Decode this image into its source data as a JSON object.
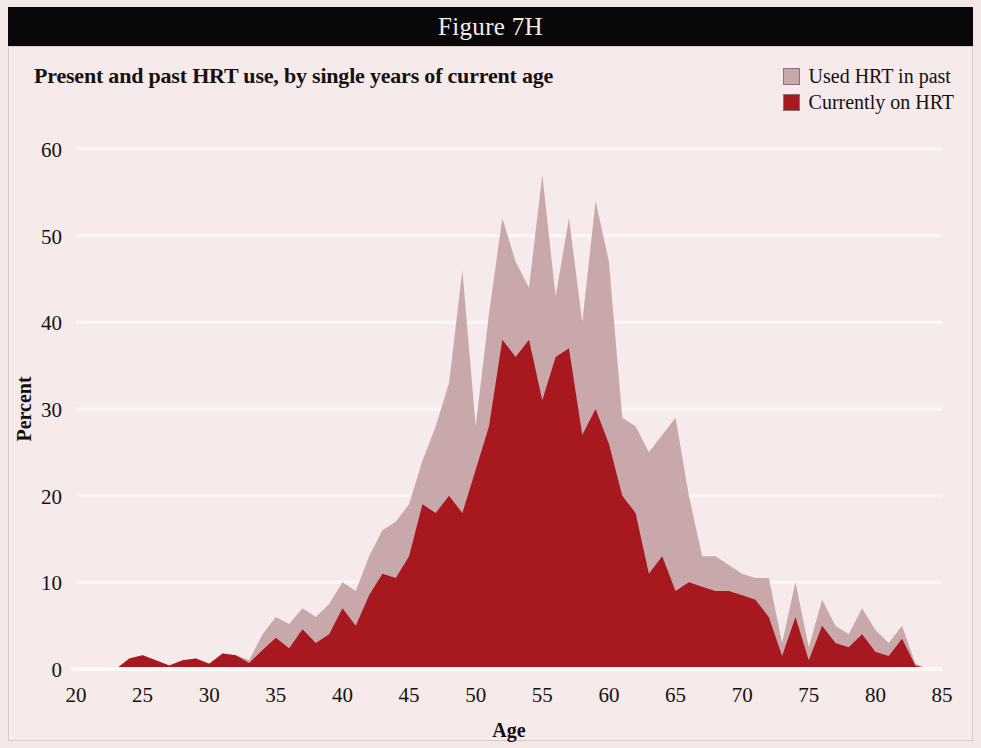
{
  "figure": {
    "header_label": "Figure 7H"
  },
  "chart_title": "Present and past HRT use, by single years of current age",
  "legend": {
    "position": "top-right",
    "entries": [
      {
        "label": "Used HRT in past",
        "color": "#c9a8ab"
      },
      {
        "label": "Currently on HRT",
        "color": "#a8191f"
      }
    ]
  },
  "colors": {
    "panel_background": "#f6eaea",
    "page_background": "#f3e7e7",
    "header_bar": "#0a0708",
    "gridline": "#fdf7f6",
    "past_hrt": "#c9a8ab",
    "current_hrt": "#a8191f",
    "text": "#15100f"
  },
  "chart_data": {
    "type": "area",
    "title": "Present and past HRT use, by single years of current age",
    "subtitle": "",
    "xlabel": "Age",
    "ylabel": "Percent",
    "xlim": [
      20,
      85
    ],
    "ylim": [
      0,
      60
    ],
    "xticks": [
      20,
      25,
      30,
      35,
      40,
      45,
      50,
      55,
      60,
      65,
      70,
      75,
      80,
      85
    ],
    "yticks": [
      0,
      10,
      20,
      30,
      40,
      50,
      60
    ],
    "grid": true,
    "stacking": "overlaid",
    "legend_position": "top-right",
    "x": [
      20,
      21,
      22,
      23,
      24,
      25,
      26,
      27,
      28,
      29,
      30,
      31,
      32,
      33,
      34,
      35,
      36,
      37,
      38,
      39,
      40,
      41,
      42,
      43,
      44,
      45,
      46,
      47,
      48,
      49,
      50,
      51,
      52,
      53,
      54,
      55,
      56,
      57,
      58,
      59,
      60,
      61,
      62,
      63,
      64,
      65,
      66,
      67,
      68,
      69,
      70,
      71,
      72,
      73,
      74,
      75,
      76,
      77,
      78,
      79,
      80,
      81,
      82,
      83,
      84,
      85
    ],
    "series": [
      {
        "name": "Used HRT in past",
        "color": "#c9a8ab",
        "values": [
          0,
          0,
          0,
          0,
          1.2,
          1.6,
          1.0,
          0.4,
          1.0,
          1.2,
          0.6,
          1.8,
          1.6,
          1.0,
          4.0,
          6.0,
          5.2,
          7.0,
          6.0,
          7.5,
          10.0,
          9.0,
          13.0,
          16.0,
          17.0,
          19.0,
          24.0,
          28.0,
          33.0,
          46.0,
          28.0,
          41.0,
          52.0,
          47.0,
          44.0,
          57.0,
          43.0,
          52.0,
          40.0,
          54.0,
          47.0,
          29.0,
          28.0,
          25.0,
          27.0,
          29.0,
          20.0,
          13.0,
          13.0,
          12.0,
          11.0,
          10.5,
          10.5,
          3.0,
          10.0,
          2.5,
          8.0,
          5.0,
          4.0,
          7.0,
          4.5,
          3.0,
          5.0,
          0.6,
          0,
          0
        ]
      },
      {
        "name": "Currently on HRT",
        "color": "#a8191f",
        "values": [
          0,
          0,
          0,
          0,
          1.2,
          1.6,
          1.0,
          0.4,
          1.0,
          1.2,
          0.6,
          1.8,
          1.6,
          0.7,
          2.2,
          3.6,
          2.4,
          4.6,
          3.0,
          4.0,
          7.0,
          5.0,
          8.5,
          11.0,
          10.5,
          13.0,
          19.0,
          18.0,
          20.0,
          18.0,
          23.0,
          28.0,
          38.0,
          36.0,
          38.0,
          31.0,
          36.0,
          37.0,
          27.0,
          30.0,
          26.0,
          20.0,
          18.0,
          11.0,
          13.0,
          9.0,
          10.0,
          9.5,
          9.0,
          9.0,
          8.5,
          8.0,
          6.0,
          1.5,
          6.0,
          1.0,
          5.0,
          3.0,
          2.5,
          4.0,
          2.0,
          1.5,
          3.5,
          0.4,
          0,
          0
        ]
      }
    ]
  }
}
